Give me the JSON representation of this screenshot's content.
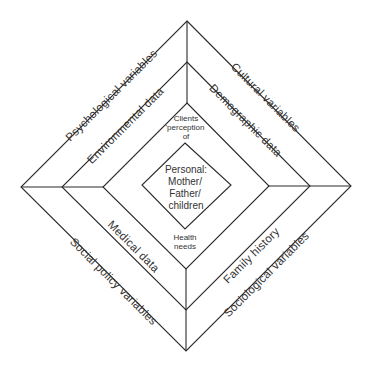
{
  "diagram": {
    "rings": {
      "outer": {
        "top_left": "Psychological variables",
        "top_right": "Cultural variables",
        "bottom_left": "Social policy variables",
        "bottom_right": "Sociological variables"
      },
      "middle": {
        "top_left": "Environmental data",
        "top_right": "Demographic data",
        "bottom_left": "Medical data",
        "bottom_right": "Family history"
      },
      "inner": {
        "top_lines": [
          "Clients",
          "'perception",
          "of"
        ],
        "bottom_lines": [
          "Health",
          "needs"
        ]
      }
    },
    "center": {
      "lines": [
        "Personal:",
        "Mother/",
        "Father/",
        "children"
      ]
    }
  }
}
